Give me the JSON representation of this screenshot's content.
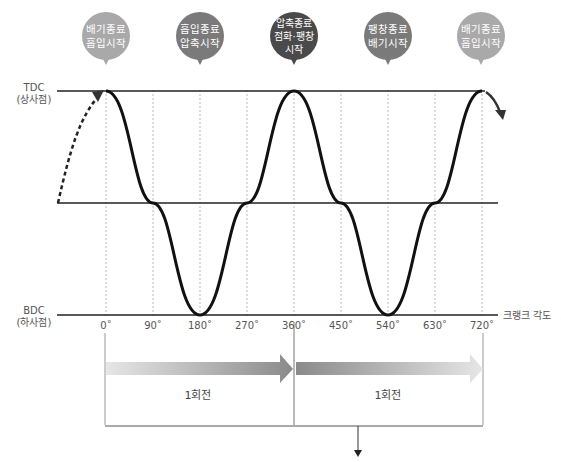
{
  "bubbles": [
    {
      "line1": "배기종료",
      "line2": "흡입시작",
      "line3": "",
      "color": "#a9a9a9",
      "x": 106
    },
    {
      "line1": "흡입종료",
      "line2": "압축시작",
      "line3": "",
      "color": "#7a7a7a",
      "x": 200
    },
    {
      "line1": "압축종료",
      "line2": "점화·팽창",
      "line3": "시작",
      "color": "#4a4a4a",
      "x": 295
    },
    {
      "line1": "팽창종료",
      "line2": "배기시작",
      "line3": "",
      "color": "#7a7a7a",
      "x": 388
    },
    {
      "line1": "배기종료",
      "line2": "흡입시작",
      "line3": "",
      "color": "#a9a9a9",
      "x": 481
    }
  ],
  "axis": {
    "tdc_label": "TDC",
    "tdc_sub": "(상사점)",
    "bdc_label": "BDC",
    "bdc_sub": "(하사점)",
    "x_title": "크랭크 각도",
    "ticks": [
      "0˚",
      "90˚",
      "180˚",
      "270˚",
      "360˚",
      "450˚",
      "540˚",
      "630˚",
      "720˚"
    ]
  },
  "rotations": [
    {
      "label": "1회전"
    },
    {
      "label": "1회전"
    }
  ]
}
